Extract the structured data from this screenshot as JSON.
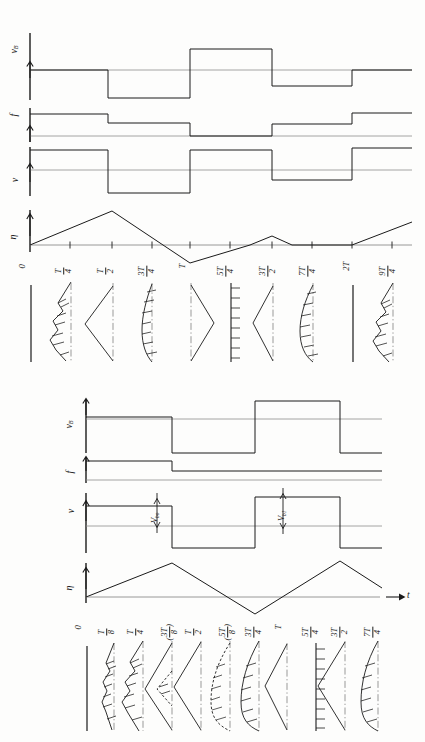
{
  "figure": {
    "kind": "technical-waveform-diagram",
    "orientation": "rotated-90-ccw",
    "ink_color": "#1a1a1a",
    "paper_color": "#fdfdfc"
  },
  "axis_labels": {
    "v_b": "v",
    "v_b_sub": "B",
    "f": "f",
    "v": "v",
    "eta": "η",
    "t": "t"
  },
  "annotations": {
    "v_bo_main": "V",
    "v_bo_sub": "bo",
    "v_b1_main": "V",
    "v_b1_sub": "b1"
  },
  "panels": {
    "top": {
      "traces": [
        "v_B",
        "f",
        "v",
        "eta"
      ],
      "ticks": [
        {
          "label_type": "plain",
          "text": "0"
        },
        {
          "label_type": "frac",
          "num": "T",
          "den": "4"
        },
        {
          "label_type": "frac",
          "num": "T",
          "den": "2"
        },
        {
          "label_type": "frac",
          "num": "3T",
          "den": "4"
        },
        {
          "label_type": "plain",
          "text": "T"
        },
        {
          "label_type": "frac",
          "num": "5T",
          "den": "4"
        },
        {
          "label_type": "frac",
          "num": "3T",
          "den": "2"
        },
        {
          "label_type": "frac",
          "num": "7T",
          "den": "4"
        },
        {
          "label_type": "plain",
          "text": "2T"
        },
        {
          "label_type": "frac",
          "num": "9T",
          "den": "4"
        }
      ],
      "profile_shapes": [
        "flat-line",
        "sawtooth-hatched",
        "triangle-left",
        "curved-hatched",
        "triangle-right",
        "hatched-ruler",
        "triangle-left",
        "curved-hatched",
        "flat-line",
        "sawtooth-hatched"
      ]
    },
    "bottom": {
      "traces": [
        "v_B",
        "f",
        "v",
        "eta"
      ],
      "ticks": [
        {
          "label_type": "plain",
          "text": "0"
        },
        {
          "label_type": "frac",
          "num": "T",
          "den": "8"
        },
        {
          "label_type": "frac",
          "num": "T",
          "den": "4"
        },
        {
          "label_type": "frac_paren",
          "num": "3T",
          "den": "8"
        },
        {
          "label_type": "frac",
          "num": "T",
          "den": "2"
        },
        {
          "label_type": "frac_paren",
          "num": "5T",
          "den": "8"
        },
        {
          "label_type": "frac",
          "num": "3T",
          "den": "4"
        },
        {
          "label_type": "plain",
          "text": "T"
        },
        {
          "label_type": "frac",
          "num": "5T",
          "den": "4"
        },
        {
          "label_type": "frac",
          "num": "3T",
          "den": "2"
        },
        {
          "label_type": "frac",
          "num": "7T",
          "den": "4"
        }
      ],
      "profile_shapes": [
        "flat-line",
        "sawtooth-hatched",
        "sawtooth-hatched",
        "triangle-left-dashed",
        "triangle-right",
        "curved-dashed-hatched",
        "curved-hatched",
        "triangle-right",
        "hatched-ruler",
        "triangle-left",
        "curved-hatched"
      ]
    }
  },
  "chart_data": {
    "type": "line",
    "xlabel": "t",
    "ylabel": "",
    "grid": false,
    "legend_position": "none",
    "panels": [
      {
        "name": "top",
        "x_ticks": [
          0,
          0.25,
          0.5,
          0.75,
          1.0,
          1.25,
          1.5,
          1.75,
          2.0,
          2.25
        ],
        "x_tick_labels": [
          "0",
          "T/4",
          "T/2",
          "3T/4",
          "T",
          "5T/4",
          "3T/2",
          "7T/4",
          "2T",
          "9T/4"
        ],
        "series": [
          {
            "name": "v_B",
            "type": "step",
            "x": [
              0,
              0.25,
              0.25,
              0.5,
              0.5,
              0.75,
              0.75,
              1.0,
              1.0,
              1.25,
              1.25,
              1.5,
              1.5,
              1.75,
              1.75,
              2.0,
              2.0,
              2.25
            ],
            "values": [
              0,
              0,
              -1.0,
              -1.0,
              -1.0,
              -1.0,
              0.8,
              0.8,
              0.8,
              0.8,
              0.8,
              0.8,
              -0.55,
              -0.55,
              -0.55,
              -0.55,
              0,
              0
            ]
          },
          {
            "name": "f",
            "type": "step",
            "x": [
              0,
              0.25,
              0.25,
              0.75,
              0.75,
              1.5,
              1.5,
              2.0,
              2.0,
              2.25
            ],
            "values": [
              1.0,
              1.0,
              0.55,
              0.55,
              0,
              0,
              0.5,
              0.5,
              0.95,
              0.95
            ]
          },
          {
            "name": "v",
            "type": "step",
            "x": [
              0,
              0.25,
              0.25,
              0.75,
              0.75,
              1.5,
              1.5,
              2.0,
              2.0,
              2.25
            ],
            "values": [
              0.8,
              0.8,
              -1.0,
              -1.0,
              0.8,
              0.8,
              -0.45,
              -0.45,
              0.8,
              0.8
            ]
          },
          {
            "name": "eta",
            "type": "triangle",
            "x": [
              0,
              0.5,
              1.125,
              1.5,
              2.0,
              2.25
            ],
            "values": [
              0,
              1.0,
              -0.42,
              0.52,
              0,
              0.42
            ]
          }
        ]
      },
      {
        "name": "bottom",
        "x_ticks": [
          0,
          0.125,
          0.25,
          0.375,
          0.5,
          0.625,
          0.75,
          1.0,
          1.25,
          1.5,
          1.75
        ],
        "x_tick_labels": [
          "0",
          "T/8",
          "T/4",
          "(3T/8)",
          "T/2",
          "(5T/8)",
          "3T/4",
          "T",
          "5T/4",
          "3T/2",
          "7T/4"
        ],
        "series": [
          {
            "name": "v_B",
            "type": "step",
            "x": [
              0,
              0.375,
              0.375,
              0.75,
              0.75,
              1.25,
              1.25,
              1.75
            ],
            "values": [
              0.15,
              0.15,
              -1.0,
              -1.0,
              1.0,
              1.0,
              -1.0,
              -1.0
            ]
          },
          {
            "name": "f",
            "type": "step",
            "x": [
              0,
              0.375,
              0.375,
              1.75
            ],
            "values": [
              0.62,
              0.62,
              0.18,
              0.18
            ]
          },
          {
            "name": "v",
            "type": "step",
            "x": [
              0,
              0.375,
              0.375,
              0.75,
              0.75,
              1.25,
              1.25,
              1.75
            ],
            "values": [
              0.45,
              0.45,
              -1.0,
              -1.0,
              0.9,
              0.9,
              -1.0,
              -1.0
            ]
          },
          {
            "name": "eta",
            "type": "triangle",
            "x": [
              0,
              0.5,
              0.9,
              1.5,
              1.75
            ],
            "values": [
              0,
              1.0,
              -0.55,
              1.0,
              0.35
            ]
          }
        ]
      }
    ]
  }
}
